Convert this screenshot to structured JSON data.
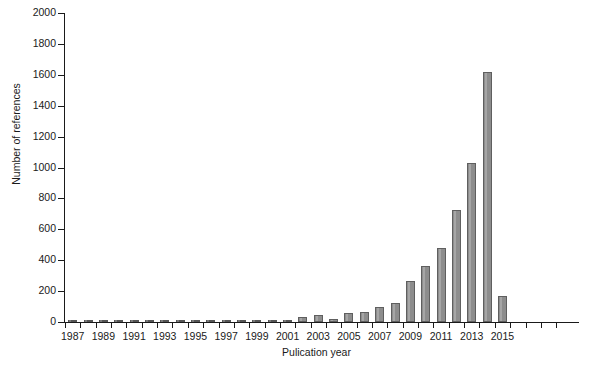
{
  "chart_data": {
    "type": "bar",
    "title": "",
    "xlabel": "Pulication year",
    "ylabel": "Number of references",
    "ylim": [
      0,
      2000
    ],
    "yticks": [
      0,
      200,
      400,
      600,
      800,
      1000,
      1200,
      1400,
      1600,
      1800,
      2000
    ],
    "ytick_labels": [
      "0",
      "200",
      "400",
      "600",
      "800",
      "1000",
      "1200",
      "1400",
      "1600",
      "1800",
      "2000"
    ],
    "xtick_labels": [
      "1987",
      "1989",
      "1991",
      "1993",
      "1995",
      "1997",
      "1999",
      "2001",
      "2003",
      "2005",
      "2007",
      "2009",
      "2011",
      "2013",
      "2015"
    ],
    "grid": false,
    "legend": null,
    "bar_color": "#8d8d8d",
    "bar_edge_color": "#5f5f5f",
    "background": "#ffffff",
    "axis_color": "#1a1a1a",
    "categories": [
      "1987",
      "1988",
      "1989",
      "1990",
      "1991",
      "1992",
      "1993",
      "1994",
      "1995",
      "1996",
      "1997",
      "1998",
      "1999",
      "2000",
      "2001",
      "2002",
      "2003",
      "2004",
      "2005",
      "2006",
      "2007",
      "2008",
      "2009",
      "2010",
      "2011",
      "2012",
      "2013",
      "2014",
      "2015"
    ],
    "values": [
      3,
      2,
      4,
      3,
      5,
      3,
      4,
      3,
      5,
      4,
      8,
      5,
      7,
      10,
      14,
      30,
      45,
      22,
      60,
      68,
      95,
      125,
      265,
      365,
      480,
      725,
      1030,
      1620,
      170
    ]
  }
}
